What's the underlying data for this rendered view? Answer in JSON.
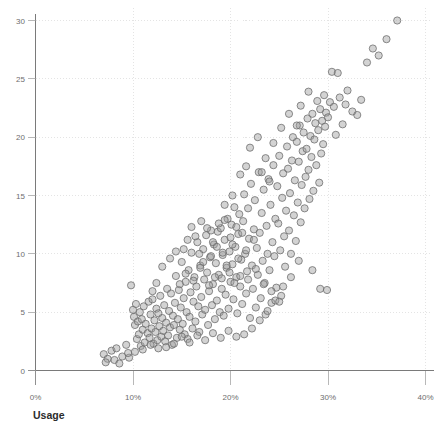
{
  "chart_data": {
    "type": "scatter",
    "title": "",
    "clipped_top_text": "",
    "xlabel": "Usage",
    "ylabel": "",
    "xlim": [
      0,
      40
    ],
    "ylim": [
      0,
      30.8
    ],
    "xtick_labels": [
      "0%",
      "10%",
      "20%",
      "30%",
      "40%"
    ],
    "xtick_values": [
      0,
      10,
      20,
      30,
      40
    ],
    "ytick_labels": [
      "0",
      "5",
      "10",
      "15",
      "20",
      "25",
      "30"
    ],
    "ytick_values": [
      0,
      5,
      10,
      15,
      20,
      25,
      30
    ],
    "grid": true,
    "legend": "none",
    "marker": {
      "shape": "circle",
      "fill_color": "#9e9e9e",
      "stroke_color": "#6a6a6a",
      "radius_px": 3.6,
      "opacity": 0.45
    },
    "n_points": 320,
    "points": [
      [
        7.0,
        1.4
      ],
      [
        7.4,
        1.0
      ],
      [
        7.8,
        1.7
      ],
      [
        8.1,
        0.9
      ],
      [
        8.3,
        1.9
      ],
      [
        8.6,
        0.6
      ],
      [
        7.2,
        0.7
      ],
      [
        8.9,
        1.2
      ],
      [
        9.3,
        2.2
      ],
      [
        9.6,
        1.1
      ],
      [
        9.8,
        7.3
      ],
      [
        10.0,
        5.2
      ],
      [
        10.1,
        4.6
      ],
      [
        10.2,
        3.9
      ],
      [
        10.3,
        5.7
      ],
      [
        10.4,
        2.7
      ],
      [
        10.5,
        4.2
      ],
      [
        10.6,
        3.1
      ],
      [
        10.7,
        5.0
      ],
      [
        10.8,
        2.1
      ],
      [
        10.9,
        4.4
      ],
      [
        11.0,
        3.5
      ],
      [
        11.1,
        5.5
      ],
      [
        11.2,
        2.4
      ],
      [
        11.3,
        4.0
      ],
      [
        11.5,
        3.2
      ],
      [
        11.6,
        5.9
      ],
      [
        11.7,
        2.8
      ],
      [
        11.8,
        4.8
      ],
      [
        11.9,
        3.6
      ],
      [
        12.0,
        6.1
      ],
      [
        12.1,
        2.3
      ],
      [
        12.2,
        4.3
      ],
      [
        12.3,
        3.3
      ],
      [
        12.4,
        5.3
      ],
      [
        12.5,
        2.6
      ],
      [
        12.6,
        4.9
      ],
      [
        12.7,
        3.8
      ],
      [
        12.8,
        6.4
      ],
      [
        12.9,
        2.9
      ],
      [
        13.0,
        4.5
      ],
      [
        13.1,
        3.4
      ],
      [
        13.2,
        5.6
      ],
      [
        13.3,
        2.5
      ],
      [
        13.4,
        4.1
      ],
      [
        13.5,
        7.0
      ],
      [
        13.6,
        3.0
      ],
      [
        13.7,
        5.1
      ],
      [
        13.8,
        3.7
      ],
      [
        13.9,
        6.6
      ],
      [
        14.0,
        2.2
      ],
      [
        14.1,
        4.7
      ],
      [
        14.2,
        3.9
      ],
      [
        14.3,
        5.8
      ],
      [
        14.4,
        8.1
      ],
      [
        14.5,
        2.8
      ],
      [
        14.6,
        4.4
      ],
      [
        14.7,
        6.9
      ],
      [
        14.8,
        3.5
      ],
      [
        14.9,
        5.4
      ],
      [
        15.0,
        9.3
      ],
      [
        15.1,
        4.0
      ],
      [
        15.2,
        6.2
      ],
      [
        15.3,
        3.1
      ],
      [
        15.4,
        7.6
      ],
      [
        15.5,
        5.0
      ],
      [
        15.6,
        2.7
      ],
      [
        15.7,
        8.6
      ],
      [
        15.8,
        4.6
      ],
      [
        15.9,
        6.7
      ],
      [
        16.0,
        10.1
      ],
      [
        16.1,
        3.6
      ],
      [
        16.2,
        5.9
      ],
      [
        16.3,
        8.0
      ],
      [
        16.4,
        4.2
      ],
      [
        16.5,
        7.2
      ],
      [
        16.6,
        11.0
      ],
      [
        16.7,
        5.5
      ],
      [
        16.8,
        3.3
      ],
      [
        16.9,
        9.0
      ],
      [
        17.0,
        6.3
      ],
      [
        17.1,
        4.8
      ],
      [
        17.2,
        10.4
      ],
      [
        17.3,
        7.8
      ],
      [
        17.4,
        5.2
      ],
      [
        17.5,
        11.6
      ],
      [
        17.6,
        8.4
      ],
      [
        17.7,
        3.9
      ],
      [
        17.8,
        6.8
      ],
      [
        17.9,
        9.7
      ],
      [
        18.0,
        12.0
      ],
      [
        18.1,
        5.6
      ],
      [
        18.2,
        7.4
      ],
      [
        18.3,
        10.8
      ],
      [
        18.4,
        4.4
      ],
      [
        18.5,
        9.2
      ],
      [
        18.6,
        6.0
      ],
      [
        18.7,
        11.9
      ],
      [
        18.8,
        8.2
      ],
      [
        18.9,
        5.0
      ],
      [
        19.0,
        12.2
      ],
      [
        19.1,
        7.0
      ],
      [
        19.2,
        9.9
      ],
      [
        19.3,
        4.7
      ],
      [
        19.4,
        11.2
      ],
      [
        19.5,
        6.5
      ],
      [
        19.6,
        8.8
      ],
      [
        19.7,
        13.0
      ],
      [
        19.8,
        5.3
      ],
      [
        19.9,
        10.2
      ],
      [
        20.0,
        7.6
      ],
      [
        20.1,
        12.5
      ],
      [
        20.2,
        9.1
      ],
      [
        20.3,
        6.1
      ],
      [
        20.4,
        14.0
      ],
      [
        20.5,
        10.6
      ],
      [
        20.6,
        8.0
      ],
      [
        20.7,
        4.9
      ],
      [
        20.8,
        11.7
      ],
      [
        20.9,
        13.4
      ],
      [
        21.0,
        7.2
      ],
      [
        21.1,
        9.5
      ],
      [
        21.2,
        5.7
      ],
      [
        21.3,
        12.8
      ],
      [
        21.4,
        15.1
      ],
      [
        21.5,
        10.0
      ],
      [
        21.6,
        6.6
      ],
      [
        21.7,
        8.5
      ],
      [
        21.8,
        13.9
      ],
      [
        21.9,
        11.3
      ],
      [
        22.0,
        4.5
      ],
      [
        22.1,
        16.0
      ],
      [
        22.2,
        9.0
      ],
      [
        22.3,
        7.0
      ],
      [
        22.4,
        12.1
      ],
      [
        22.5,
        14.6
      ],
      [
        22.6,
        5.4
      ],
      [
        22.7,
        10.5
      ],
      [
        22.8,
        8.2
      ],
      [
        22.9,
        17.0
      ],
      [
        23.0,
        11.8
      ],
      [
        23.1,
        6.2
      ],
      [
        23.2,
        13.5
      ],
      [
        23.3,
        9.4
      ],
      [
        23.4,
        15.5
      ],
      [
        23.5,
        7.5
      ],
      [
        23.6,
        4.8
      ],
      [
        23.7,
        12.4
      ],
      [
        23.8,
        10.0
      ],
      [
        23.9,
        16.4
      ],
      [
        24.0,
        8.6
      ],
      [
        24.1,
        14.2
      ],
      [
        24.2,
        5.8
      ],
      [
        24.3,
        11.0
      ],
      [
        24.4,
        17.6
      ],
      [
        24.5,
        9.8
      ],
      [
        24.6,
        13.0
      ],
      [
        24.7,
        7.1
      ],
      [
        24.8,
        15.8
      ],
      [
        24.9,
        12.6
      ],
      [
        25.0,
        18.4
      ],
      [
        25.1,
        10.3
      ],
      [
        25.2,
        6.4
      ],
      [
        25.3,
        14.8
      ],
      [
        25.4,
        16.9
      ],
      [
        25.5,
        11.5
      ],
      [
        25.6,
        8.9
      ],
      [
        25.7,
        13.7
      ],
      [
        25.8,
        19.2
      ],
      [
        25.9,
        17.3
      ],
      [
        26.0,
        12.0
      ],
      [
        26.1,
        15.2
      ],
      [
        26.2,
        10.0
      ],
      [
        26.3,
        18.0
      ],
      [
        26.4,
        20.0
      ],
      [
        26.5,
        13.3
      ],
      [
        26.6,
        16.3
      ],
      [
        26.7,
        11.1
      ],
      [
        26.8,
        19.6
      ],
      [
        26.9,
        14.4
      ],
      [
        27.0,
        17.9
      ],
      [
        27.1,
        21.0
      ],
      [
        27.2,
        12.7
      ],
      [
        27.3,
        15.9
      ],
      [
        27.4,
        18.8
      ],
      [
        27.5,
        20.4
      ],
      [
        27.6,
        13.9
      ],
      [
        27.7,
        16.6
      ],
      [
        27.8,
        19.0
      ],
      [
        27.9,
        21.6
      ],
      [
        28.0,
        17.2
      ],
      [
        28.1,
        14.7
      ],
      [
        28.2,
        20.1
      ],
      [
        28.3,
        18.3
      ],
      [
        28.4,
        22.0
      ],
      [
        28.5,
        15.4
      ],
      [
        28.6,
        19.8
      ],
      [
        28.7,
        21.2
      ],
      [
        28.8,
        17.6
      ],
      [
        28.9,
        23.1
      ],
      [
        29.0,
        20.6
      ],
      [
        29.1,
        16.1
      ],
      [
        29.2,
        22.4
      ],
      [
        29.3,
        18.6
      ],
      [
        29.4,
        21.4
      ],
      [
        29.5,
        19.4
      ],
      [
        29.6,
        23.6
      ],
      [
        29.7,
        20.9
      ],
      [
        29.8,
        22.1
      ],
      [
        29.9,
        6.9
      ],
      [
        30.0,
        21.7
      ],
      [
        30.2,
        23.0
      ],
      [
        30.4,
        25.6
      ],
      [
        30.6,
        22.6
      ],
      [
        30.8,
        20.2
      ],
      [
        31.0,
        25.5
      ],
      [
        31.2,
        23.4
      ],
      [
        31.5,
        21.1
      ],
      [
        31.8,
        22.8
      ],
      [
        32.0,
        24.0
      ],
      [
        32.5,
        22.2
      ],
      [
        33.0,
        21.9
      ],
      [
        33.4,
        23.2
      ],
      [
        34.0,
        26.4
      ],
      [
        34.6,
        27.6
      ],
      [
        35.2,
        27.0
      ],
      [
        36.0,
        28.4
      ],
      [
        37.1,
        30.0
      ],
      [
        29.2,
        7.0
      ],
      [
        28.4,
        8.6
      ],
      [
        27.0,
        9.4
      ],
      [
        26.2,
        8.0
      ],
      [
        25.4,
        7.2
      ],
      [
        24.6,
        6.0
      ],
      [
        23.8,
        5.1
      ],
      [
        23.0,
        4.3
      ],
      [
        22.2,
        3.6
      ],
      [
        21.4,
        3.1
      ],
      [
        20.6,
        2.9
      ],
      [
        19.8,
        3.4
      ],
      [
        19.0,
        2.8
      ],
      [
        18.2,
        3.2
      ],
      [
        17.4,
        2.6
      ],
      [
        16.6,
        3.0
      ],
      [
        15.8,
        2.4
      ],
      [
        15.0,
        2.9
      ],
      [
        14.2,
        2.3
      ],
      [
        13.4,
        2.0
      ],
      [
        12.6,
        1.9
      ],
      [
        11.8,
        2.2
      ],
      [
        11.0,
        1.8
      ],
      [
        10.2,
        1.6
      ],
      [
        9.5,
        1.5
      ],
      [
        16.0,
        12.3
      ],
      [
        16.4,
        11.5
      ],
      [
        17.0,
        12.8
      ],
      [
        17.6,
        12.2
      ],
      [
        18.2,
        11.0
      ],
      [
        18.8,
        12.6
      ],
      [
        19.4,
        12.9
      ],
      [
        20.0,
        11.4
      ],
      [
        20.6,
        12.3
      ],
      [
        21.2,
        11.8
      ],
      [
        15.6,
        11.2
      ],
      [
        15.2,
        10.4
      ],
      [
        16.8,
        10.0
      ],
      [
        17.2,
        9.3
      ],
      [
        18.0,
        9.8
      ],
      [
        18.6,
        10.6
      ],
      [
        19.2,
        10.1
      ],
      [
        19.6,
        9.0
      ],
      [
        20.2,
        10.8
      ],
      [
        20.8,
        9.6
      ],
      [
        21.6,
        10.3
      ],
      [
        22.4,
        11.2
      ],
      [
        14.8,
        7.4
      ],
      [
        15.4,
        8.3
      ],
      [
        16.2,
        7.7
      ],
      [
        16.9,
        8.8
      ],
      [
        17.8,
        7.3
      ],
      [
        18.4,
        8.0
      ],
      [
        19.1,
        7.9
      ],
      [
        19.9,
        8.4
      ],
      [
        20.4,
        7.5
      ],
      [
        21.0,
        8.1
      ],
      [
        21.8,
        7.8
      ],
      [
        22.6,
        8.7
      ],
      [
        23.4,
        7.4
      ],
      [
        24.2,
        6.8
      ],
      [
        25.0,
        5.9
      ],
      [
        13.0,
        8.9
      ],
      [
        13.8,
        9.6
      ],
      [
        14.4,
        10.2
      ],
      [
        12.4,
        7.5
      ],
      [
        12.0,
        6.8
      ],
      [
        22.0,
        19.1
      ],
      [
        22.8,
        20.0
      ],
      [
        23.6,
        18.2
      ],
      [
        24.4,
        19.5
      ],
      [
        25.2,
        20.8
      ],
      [
        21.0,
        16.8
      ],
      [
        21.6,
        17.5
      ],
      [
        20.2,
        15.0
      ],
      [
        19.4,
        14.2
      ],
      [
        23.2,
        17.0
      ],
      [
        24.0,
        16.2
      ],
      [
        26.0,
        22.0
      ],
      [
        26.8,
        21.0
      ],
      [
        27.2,
        22.7
      ],
      [
        28.0,
        23.9
      ]
    ]
  },
  "axes": {
    "x_axis_name": "usage-axis",
    "y_axis_name": "value-axis"
  }
}
